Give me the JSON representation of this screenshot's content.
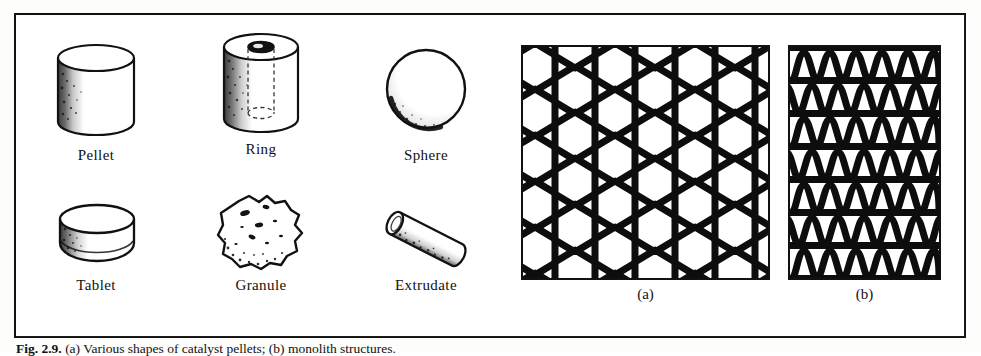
{
  "figure": {
    "caption_prefix": "Fig. 2.9.",
    "caption_text": "(a) Various shapes of catalyst pellets; (b) monolith structures.",
    "frame_color": "#111111",
    "background": "#ffffff"
  },
  "shapes": [
    {
      "id": "pellet",
      "label": "Pellet",
      "icon": "cylinder-pellet-icon"
    },
    {
      "id": "ring",
      "label": "Ring",
      "icon": "hollow-cylinder-ring-icon"
    },
    {
      "id": "sphere",
      "label": "Sphere",
      "icon": "sphere-icon"
    },
    {
      "id": "tablet",
      "label": "Tablet",
      "icon": "short-cylinder-tablet-icon"
    },
    {
      "id": "granule",
      "label": "Granule",
      "icon": "irregular-granule-icon"
    },
    {
      "id": "extrudate",
      "label": "Extrudate",
      "icon": "tilted-rod-extrudate-icon"
    }
  ],
  "monoliths": [
    {
      "id": "honeycomb",
      "label": "(a)",
      "icon": "honeycomb-monolith-icon"
    },
    {
      "id": "corrugated",
      "label": "(b)",
      "icon": "corrugated-monolith-icon"
    }
  ]
}
